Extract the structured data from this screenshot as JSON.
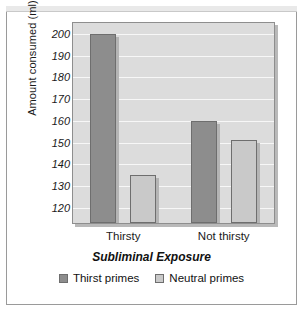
{
  "chart_data": {
    "type": "bar",
    "title": "",
    "xlabel": "Subliminal Exposure",
    "ylabel": "Amount consumed (ml)",
    "categories": [
      "Thirsty",
      "Not thirsty"
    ],
    "series": [
      {
        "name": "Thirst primes",
        "color": "#8d8d8d",
        "values": [
          200,
          160
        ]
      },
      {
        "name": "Neutral primes",
        "color": "#c9c9c9",
        "values": [
          135,
          151
        ]
      }
    ],
    "ylim": [
      113,
      205
    ],
    "yticks": [
      120,
      130,
      140,
      150,
      160,
      170,
      180,
      190,
      200
    ],
    "ytick_labels": [
      "120",
      "130",
      "140",
      "150",
      "160",
      "170",
      "180",
      "190",
      "200"
    ],
    "grid": true,
    "grid_color": "#f7f7f7",
    "legend_position": "bottom",
    "plot_background": "#dcdcdc"
  }
}
